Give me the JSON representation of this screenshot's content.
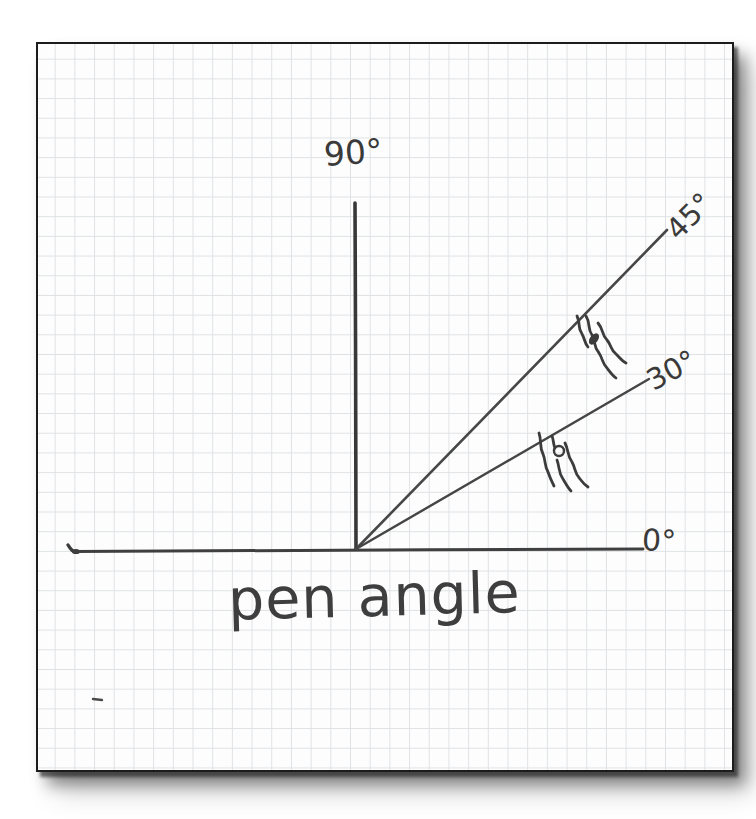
{
  "figure": {
    "title": "pen angle",
    "labels": {
      "deg_90": "90°",
      "deg_45": "45°",
      "deg_30": "30°",
      "deg_0": "0°"
    }
  },
  "diagram": {
    "type": "hand-drawn angle diagram on graph paper",
    "angles_deg": [
      0,
      30,
      45,
      90
    ],
    "rays": [
      {
        "label": "90°",
        "angle_deg": 90,
        "style": "vertical axis from origin"
      },
      {
        "label": "45°",
        "angle_deg": 45,
        "style": "ray from origin with pen-nib sketch on it"
      },
      {
        "label": "30°",
        "angle_deg": 30,
        "style": "ray from origin with pen-nib sketch on it"
      },
      {
        "label": "0°",
        "angle_deg": 0,
        "style": "horizontal axis through origin"
      }
    ],
    "annotations": [
      {
        "name": "pen-nib-sketch-45",
        "description": "small sketched pen nib touching the 45° ray"
      },
      {
        "name": "pen-nib-sketch-30",
        "description": "small sketched pen nib touching the 30° ray"
      }
    ]
  },
  "colors": {
    "ink": "#3c3c3c",
    "ray_ink": "#474747",
    "grid": "#dfe2e5",
    "paper": "#fdfdfd",
    "frame": "#1c1c1c"
  }
}
